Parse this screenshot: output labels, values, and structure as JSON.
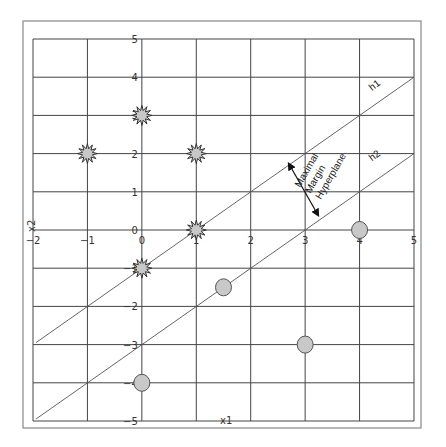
{
  "chart_data": {
    "type": "scatter",
    "title": "",
    "xlabel": "x1",
    "ylabel": "x2",
    "xlim": [
      -2,
      5
    ],
    "ylim": [
      -5,
      5
    ],
    "grid": true,
    "x_ticks": [
      -2,
      -1,
      0,
      1,
      2,
      3,
      4,
      5
    ],
    "y_ticks": [
      5,
      4,
      3,
      2,
      1,
      0,
      -1,
      -2,
      -3,
      -4,
      -5
    ],
    "series": [
      {
        "name": "class-star",
        "marker": "starburst",
        "color": "#c8c8c8",
        "points": [
          [
            0,
            3
          ],
          [
            -1,
            2
          ],
          [
            1,
            2
          ],
          [
            1,
            0
          ],
          [
            0,
            -1
          ]
        ]
      },
      {
        "name": "class-circle",
        "marker": "circle",
        "color": "#c8c8c8",
        "points": [
          [
            1.5,
            -1.5
          ],
          [
            4,
            0
          ],
          [
            3,
            -3
          ],
          [
            0,
            -4
          ]
        ]
      }
    ],
    "lines": [
      {
        "name": "h1",
        "label": "h1",
        "equation": "x2 = x1 - 1",
        "from": [
          -2,
          -3
        ],
        "to": [
          5,
          4
        ]
      },
      {
        "name": "h2",
        "label": "h2",
        "equation": "x2 = x1 - 3",
        "from": [
          -2,
          -5
        ],
        "to": [
          5,
          2
        ]
      }
    ],
    "annotations": [
      {
        "text": [
          "Maximal",
          "Margin",
          "Hyperplane"
        ],
        "arrow": "double-headed, perpendicular between h1 and h2"
      }
    ]
  }
}
